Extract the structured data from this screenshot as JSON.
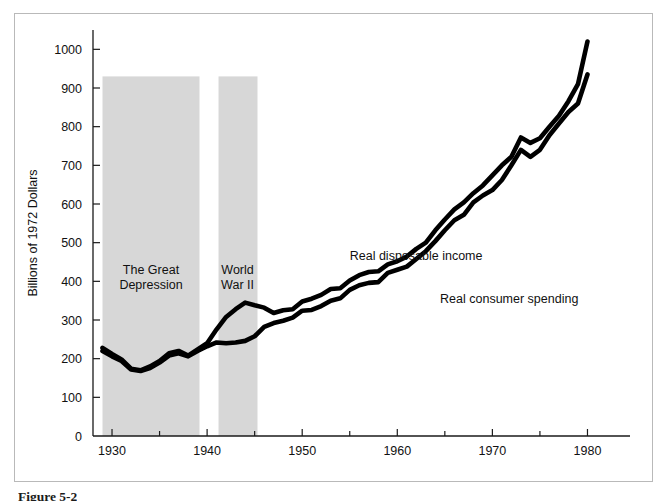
{
  "figure": {
    "caption": "Figure 5-2",
    "frame_color": "#b9b9b9",
    "background": "#ffffff"
  },
  "chart_data": {
    "type": "line",
    "title": "",
    "subtitle": "",
    "xlabel": "",
    "ylabel": "Billions of 1972 Dollars",
    "xlim": [
      1928,
      1983
    ],
    "ylim": [
      0,
      1050
    ],
    "grid": false,
    "legend_position": "inline-annotations",
    "x_ticks": [
      1930,
      1940,
      1950,
      1960,
      1970,
      1980
    ],
    "x_minor_ticks": [
      1935,
      1945,
      1955,
      1965,
      1975
    ],
    "y_ticks": [
      0,
      100,
      200,
      300,
      400,
      500,
      600,
      700,
      800,
      900,
      1000
    ],
    "series": [
      {
        "name": "Real disposable income",
        "color": "#000000",
        "label_x": 1955.0,
        "label_y": 455,
        "x": [
          1929,
          1930,
          1931,
          1932,
          1933,
          1934,
          1935,
          1936,
          1937,
          1938,
          1939,
          1940,
          1941,
          1942,
          1943,
          1944,
          1945,
          1946,
          1947,
          1948,
          1949,
          1950,
          1951,
          1952,
          1953,
          1954,
          1955,
          1956,
          1957,
          1958,
          1959,
          1960,
          1961,
          1962,
          1963,
          1964,
          1965,
          1966,
          1967,
          1968,
          1969,
          1970,
          1971,
          1972,
          1973,
          1974,
          1975,
          1976,
          1977,
          1978,
          1979,
          1980
        ],
        "values": [
          228,
          212,
          198,
          174,
          170,
          180,
          194,
          214,
          220,
          208,
          224,
          240,
          276,
          308,
          328,
          345,
          338,
          332,
          318,
          325,
          328,
          348,
          355,
          365,
          380,
          382,
          402,
          416,
          424,
          426,
          444,
          452,
          464,
          484,
          500,
          532,
          560,
          586,
          604,
          628,
          648,
          674,
          700,
          722,
          772,
          758,
          770,
          800,
          828,
          866,
          910,
          1020
        ]
      },
      {
        "name": "Real consumer spending",
        "color": "#000000",
        "label_x": 1964.5,
        "label_y": 345,
        "x": [
          1929,
          1930,
          1931,
          1932,
          1933,
          1934,
          1935,
          1936,
          1937,
          1938,
          1939,
          1940,
          1941,
          1942,
          1943,
          1944,
          1945,
          1946,
          1947,
          1948,
          1949,
          1950,
          1951,
          1952,
          1953,
          1954,
          1955,
          1956,
          1957,
          1958,
          1959,
          1960,
          1961,
          1962,
          1963,
          1964,
          1965,
          1966,
          1967,
          1968,
          1969,
          1970,
          1971,
          1972,
          1973,
          1974,
          1975,
          1976,
          1977,
          1978,
          1979,
          1980
        ],
        "values": [
          220,
          206,
          194,
          172,
          168,
          176,
          190,
          208,
          214,
          206,
          220,
          232,
          242,
          240,
          242,
          246,
          258,
          282,
          292,
          298,
          306,
          324,
          326,
          336,
          350,
          356,
          378,
          390,
          396,
          398,
          422,
          430,
          438,
          458,
          478,
          504,
          532,
          558,
          572,
          604,
          622,
          636,
          662,
          700,
          740,
          722,
          740,
          778,
          808,
          838,
          860,
          935
        ]
      }
    ],
    "shaded_bands": [
      {
        "name": "The Great Depression",
        "label_lines": [
          "The Great",
          "Depression"
        ],
        "x_start": 1929,
        "x_end": 1939.2,
        "y_top": 930,
        "color": "#d7d7d7",
        "label_x": 1934.1,
        "label_y": 418
      },
      {
        "name": "World War II",
        "label_lines": [
          "World",
          "War II"
        ],
        "x_start": 1941.2,
        "x_end": 1945.3,
        "y_top": 930,
        "color": "#d7d7d7",
        "label_x": 1943.2,
        "label_y": 418
      }
    ]
  }
}
